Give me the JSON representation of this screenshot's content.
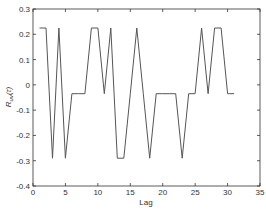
{
  "chart_data": {
    "type": "line",
    "title": "",
    "xlabel": "Lag",
    "ylabel": "R_uv(τ)",
    "ylabel_main": "R",
    "ylabel_sub": "uv",
    "ylabel_suffix": "(τ)",
    "xlim": [
      0,
      35
    ],
    "ylim": [
      -0.4,
      0.3
    ],
    "x_ticks": [
      0,
      5,
      10,
      15,
      20,
      25,
      30,
      35
    ],
    "y_ticks": [
      -0.4,
      -0.3,
      -0.2,
      -0.1,
      0,
      0.1,
      0.2,
      0.3
    ],
    "x_tick_labels": [
      "0",
      "5",
      "10",
      "15",
      "20",
      "25",
      "30",
      "35"
    ],
    "y_tick_labels": [
      "-0.4",
      "-0.3",
      "-0.2",
      "-0.1",
      "0",
      "0.1",
      "0.2",
      "0.3"
    ],
    "grid": false,
    "legend": null,
    "line_color": "#555555",
    "series": [
      {
        "name": "R_uv",
        "x": [
          1,
          2,
          3,
          4,
          5,
          6,
          7,
          8,
          9,
          10,
          11,
          12,
          13,
          14,
          15,
          16,
          17,
          18,
          19,
          20,
          21,
          22,
          23,
          24,
          25,
          26,
          27,
          28,
          29,
          30,
          31
        ],
        "values": [
          0.225,
          0.225,
          -0.29,
          0.225,
          -0.29,
          -0.035,
          -0.035,
          -0.035,
          0.225,
          0.225,
          -0.035,
          0.225,
          -0.29,
          -0.29,
          -0.035,
          0.225,
          -0.035,
          -0.29,
          -0.035,
          -0.035,
          -0.035,
          -0.035,
          -0.29,
          -0.035,
          -0.035,
          0.225,
          -0.035,
          0.225,
          0.225,
          -0.035,
          -0.035
        ]
      }
    ]
  }
}
